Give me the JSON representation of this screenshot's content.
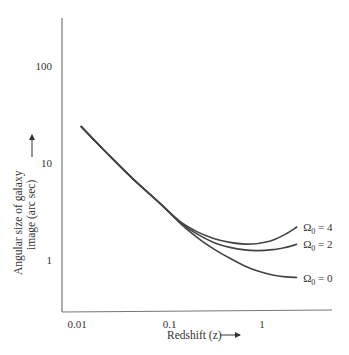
{
  "chart_data": {
    "type": "line",
    "title": "",
    "xlabel": "Redshift (z)",
    "ylabel_line1": "Angular size of galaxy",
    "ylabel_line2": "image (arc sec)",
    "xscale": "log",
    "yscale": "log",
    "xlim": [
      0.0085,
      4.5
    ],
    "ylim": [
      0.55,
      330
    ],
    "xticks": [
      {
        "value": 0.01,
        "label": "0.01"
      },
      {
        "value": 0.1,
        "label": "0.1"
      },
      {
        "value": 1,
        "label": "1"
      }
    ],
    "yticks": [
      {
        "value": 1,
        "label": "1"
      },
      {
        "value": 10,
        "label": "10"
      },
      {
        "value": 100,
        "label": "100"
      }
    ],
    "grid": false,
    "legend": "inline-right",
    "series": [
      {
        "name": "Omega0 = 4",
        "label_base": "Ω",
        "label_sub": "0",
        "label_rest": " = 4",
        "x": [
          0.011,
          0.02,
          0.04,
          0.08,
          0.13,
          0.2,
          0.3,
          0.45,
          0.65,
          0.9,
          1.3,
          1.8,
          2.4
        ],
        "y": [
          24,
          13.3,
          6.9,
          3.8,
          2.5,
          1.95,
          1.67,
          1.52,
          1.46,
          1.48,
          1.6,
          1.85,
          2.2
        ]
      },
      {
        "name": "Omega0 = 2",
        "label_base": "Ω",
        "label_sub": "0",
        "label_rest": " = 2",
        "x": [
          0.011,
          0.02,
          0.04,
          0.08,
          0.13,
          0.2,
          0.3,
          0.45,
          0.65,
          0.9,
          1.3,
          1.8,
          2.4
        ],
        "y": [
          24,
          13.3,
          6.9,
          3.8,
          2.45,
          1.85,
          1.52,
          1.35,
          1.27,
          1.25,
          1.28,
          1.35,
          1.45
        ]
      },
      {
        "name": "Omega0 = 0",
        "label_base": "Ω",
        "label_sub": "0",
        "label_rest": " = 0",
        "x": [
          0.011,
          0.02,
          0.04,
          0.08,
          0.13,
          0.2,
          0.3,
          0.45,
          0.65,
          0.9,
          1.3,
          1.8,
          2.4
        ],
        "y": [
          24,
          13.3,
          6.9,
          3.8,
          2.4,
          1.7,
          1.3,
          1.04,
          0.87,
          0.77,
          0.7,
          0.67,
          0.66
        ]
      }
    ]
  }
}
